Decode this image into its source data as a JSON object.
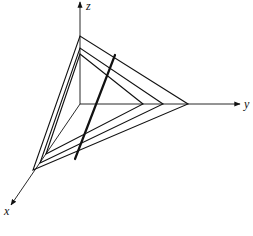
{
  "diagram": {
    "axes": {
      "origin": [
        80,
        104
      ],
      "x": {
        "label": "x",
        "tip": [
          11,
          205
        ],
        "label_pos": [
          4,
          215
        ]
      },
      "y": {
        "label": "y",
        "tip": [
          240,
          104
        ],
        "label_pos": [
          244,
          108
        ]
      },
      "z": {
        "label": "z",
        "tip": [
          80,
          2
        ],
        "label_pos": [
          86,
          10
        ]
      }
    },
    "planes": [
      {
        "name": "plane-1",
        "x_pt": [
          46,
          154
        ],
        "y_pt": [
          143,
          104
        ],
        "z_pt": [
          80,
          54
        ]
      },
      {
        "name": "plane-2",
        "x_pt": [
          40,
          163
        ],
        "y_pt": [
          163,
          104
        ],
        "z_pt": [
          80,
          48
        ]
      },
      {
        "name": "plane-3",
        "x_pt": [
          33,
          170
        ],
        "y_pt": [
          188,
          104
        ],
        "z_pt": [
          80,
          36
        ]
      }
    ],
    "intersection_line": {
      "start": [
        75,
        159
      ],
      "end": [
        115,
        55
      ]
    },
    "colors": {
      "stroke": "#111111",
      "background": "#ffffff"
    }
  }
}
